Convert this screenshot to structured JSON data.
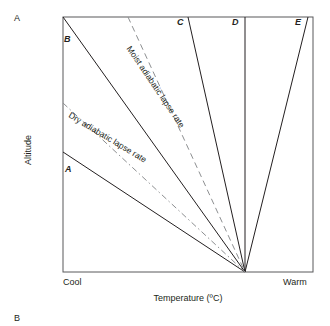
{
  "figure": {
    "panel_labels": {
      "a": "A",
      "b": "B"
    },
    "axes": {
      "x_title": "Temperature (ºC)",
      "y_title": "Altitude",
      "x_left_tick": "Cool",
      "x_right_tick": "Warm"
    },
    "annotations": {
      "dry_rate": "Dry adiabatic lapse rate",
      "moist_rate": "Moist adiabatic lapse rate"
    },
    "curve_labels": {
      "a": "A",
      "b": "B",
      "c": "C",
      "d": "D",
      "e": "E"
    },
    "colors": {
      "line": "#231f20",
      "frame": "#58595b",
      "dashed": "#8d8f91",
      "background": "#ffffff"
    }
  },
  "chart_data": {
    "type": "line",
    "title": "",
    "xlabel": "Temperature (ºC)",
    "ylabel": "Altitude",
    "grid": false,
    "legend": "none",
    "x_tick_labels": [
      "Cool",
      "Warm"
    ],
    "y_tick_labels": [],
    "plot_box": {
      "left": 63,
      "top": 17,
      "right": 313,
      "bottom": 272
    },
    "convergence_point": {
      "x": 245,
      "y": 272
    },
    "series": [
      {
        "name": "A",
        "style": "solid",
        "label_position": {
          "x": 65,
          "y": 158
        },
        "points": [
          {
            "x": 63,
            "y": 152
          },
          {
            "x": 245,
            "y": 272
          }
        ]
      },
      {
        "name": "B",
        "style": "solid",
        "label_position": {
          "x": 64,
          "y": 34
        },
        "points": [
          {
            "x": 63,
            "y": 17
          },
          {
            "x": 245,
            "y": 272
          }
        ]
      },
      {
        "name": "C",
        "style": "solid",
        "label_position": {
          "x": 177,
          "y": 17
        },
        "points": [
          {
            "x": 188,
            "y": 17
          },
          {
            "x": 245,
            "y": 272
          }
        ]
      },
      {
        "name": "D",
        "style": "solid",
        "label_position": {
          "x": 232,
          "y": 17
        },
        "points": [
          {
            "x": 245,
            "y": 17
          },
          {
            "x": 245,
            "y": 272
          }
        ]
      },
      {
        "name": "E",
        "style": "solid",
        "label_position": {
          "x": 295,
          "y": 17
        },
        "points": [
          {
            "x": 308,
            "y": 17
          },
          {
            "x": 245,
            "y": 272
          }
        ]
      },
      {
        "name": "Dry adiabatic lapse rate",
        "style": "dash-dot",
        "points": [
          {
            "x": 63,
            "y": 103
          },
          {
            "x": 245,
            "y": 272
          }
        ]
      },
      {
        "name": "Moist adiabatic lapse rate",
        "style": "dashed",
        "points": [
          {
            "x": 128,
            "y": 17
          },
          {
            "x": 245,
            "y": 272
          }
        ]
      }
    ]
  }
}
